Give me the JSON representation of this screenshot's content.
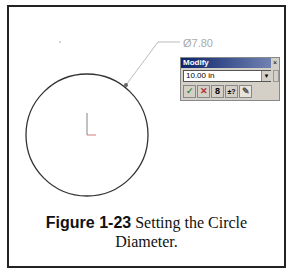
{
  "figure": {
    "label": "Figure 1-23",
    "caption_line1": " Setting the Circle",
    "caption_line2": "Diameter."
  },
  "drawing": {
    "dimension_text": "Ø7.80",
    "circle": {
      "cx": 87,
      "cy": 135,
      "r": 61
    }
  },
  "modify_dialog": {
    "title": "Modify",
    "close_label": "×",
    "value": "10.00 in",
    "buttons": [
      {
        "name": "ok-button",
        "glyph": "✓",
        "color": "#3a8a3a"
      },
      {
        "name": "cancel-button",
        "glyph": "✕",
        "color": "#b03030"
      },
      {
        "name": "rebuild-button",
        "glyph": "8",
        "color": "#222"
      },
      {
        "name": "reverse-dimension-button",
        "glyph": "±?",
        "color": "#222"
      },
      {
        "name": "mark-dimension-button",
        "glyph": "✎",
        "color": "#555"
      }
    ]
  }
}
